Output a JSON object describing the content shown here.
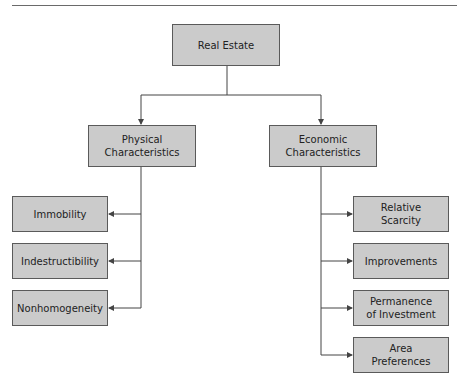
{
  "diagram": {
    "root": {
      "label": "Real Estate"
    },
    "branches": [
      {
        "label": "Physical\nCharacteristics",
        "children": [
          "Immobility",
          "Indestructibility",
          "Nonhomogeneity"
        ]
      },
      {
        "label": "Economic\nCharacteristics",
        "children": [
          "Relative\nScarcity",
          "Improvements",
          "Permanence\nof Investment",
          "Area\nPreferences"
        ]
      }
    ]
  },
  "colors": {
    "box_fill": "#cbcbcb",
    "box_border": "#5a5a5a",
    "line": "#444444"
  }
}
